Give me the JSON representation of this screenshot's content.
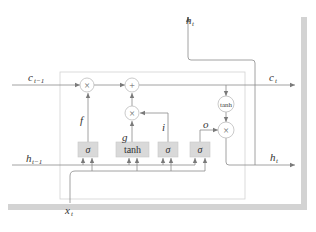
{
  "diagram": {
    "inputs": {
      "c_prev": {
        "base": "c",
        "sub": "t−1"
      },
      "h_prev": {
        "base": "h",
        "sub": "t−1"
      },
      "x": {
        "base": "x",
        "sub": "t"
      }
    },
    "outputs": {
      "c": {
        "base": "c",
        "sub": "t"
      },
      "h_right": {
        "base": "h",
        "sub": "t"
      },
      "h_top": {
        "base": "h",
        "sub": "t"
      }
    },
    "gates": [
      {
        "id": "forget",
        "symbol": "σ",
        "output_label": "f"
      },
      {
        "id": "candidate",
        "symbol": "tanh",
        "output_label": "g"
      },
      {
        "id": "input",
        "symbol": "σ",
        "output_label": "i"
      },
      {
        "id": "output",
        "symbol": "σ",
        "output_label": "o"
      }
    ],
    "operators": {
      "forget_mul": "×",
      "add": "+",
      "input_mul": "×",
      "cell_tanh": "tanh",
      "output_mul": "×"
    },
    "colors": {
      "line": "#8a8a8a",
      "gate_fill": "#d9d9d9",
      "gate_border": "#c4c4c4",
      "box_border": "#cfcfcf",
      "shadow_frame": "#d0d0d0",
      "text": "#333333"
    }
  }
}
